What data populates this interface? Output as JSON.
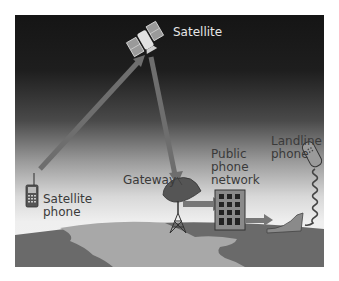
{
  "labels": {
    "satellite": "Satellite",
    "satellite_phone": [
      "Satellite",
      "phone"
    ],
    "gateway": "Gateway",
    "public_phone_network": [
      "Public",
      "phone",
      "network"
    ],
    "landline_phone": [
      "Landline",
      "phone"
    ]
  },
  "flow": [
    {
      "from": "Satellite phone",
      "to": "Satellite"
    },
    {
      "from": "Satellite",
      "to": "Gateway"
    },
    {
      "from": "Gateway",
      "to": "Public phone network"
    },
    {
      "from": "Public phone network",
      "to": "Landline phone"
    }
  ],
  "colors": {
    "sky_top": "#151515",
    "sky_bottom": "#f2f2f2",
    "beam": "#6e6e6e",
    "earth_dark": "#6a6a6a",
    "earth_light": "#a8a8a8",
    "text_dark": "#3a3a3a",
    "text_light": "#e6e6e6"
  }
}
